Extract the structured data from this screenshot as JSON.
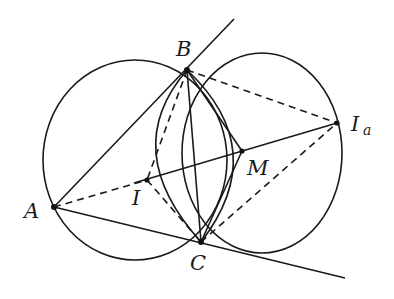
{
  "figure": {
    "points": {
      "A": {
        "label": "A"
      },
      "B": {
        "label": "B"
      },
      "C": {
        "label": "C"
      },
      "I": {
        "label": "I"
      },
      "M": {
        "label": "M"
      },
      "Ia": {
        "label": "I",
        "subscript": "a"
      }
    },
    "solid_segments": [
      "A-B (extended)",
      "A-C (extended)",
      "B-C",
      "B-M",
      "M-C",
      "I-Ia"
    ],
    "dashed_segments": [
      "A-I",
      "B-I",
      "I-C",
      "B-Ia",
      "C-Ia"
    ],
    "circles": [
      "circumcircle of ABC",
      "circle centered near I_a side through B and C",
      "lens arcs B-I-C and B-M-C"
    ],
    "colors": {
      "ink": "#1a1a1a",
      "background": "#ffffff"
    }
  }
}
